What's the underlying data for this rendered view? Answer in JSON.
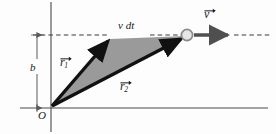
{
  "figure": {
    "type": "vector-diagram",
    "background_color": "#fdfdfd",
    "width": 276,
    "height": 134
  },
  "labels": {
    "v_dt": "v dt",
    "b": "b",
    "origin": "O",
    "r1_letter": "r",
    "r1_subscript": "1",
    "r2_letter": "r",
    "r2_subscript": "2",
    "v_letter": "v"
  },
  "colors": {
    "axis": "#4a4a4a",
    "dashed_line": "#3a3a3a",
    "vector_stroke": "#111111",
    "triangle_fill": "#9a9a9a",
    "velocity_arrow": "#4f4f4f",
    "particle_fill": "#e6e6e6",
    "particle_stroke": "#8a8a8a",
    "dimension_arrow": "#5a5a5a",
    "text": "#1a1a1a"
  },
  "geometry": {
    "origin": {
      "x": 51,
      "y": 108
    },
    "vertical_axis": {
      "x": 51,
      "y_top": 2,
      "y_bottom": 132
    },
    "horizontal_axis": {
      "y": 108,
      "x_left": 20,
      "x_right": 268
    },
    "dashed_trajectory": {
      "y": 35,
      "x_left": 33,
      "x_right": 271
    },
    "r1_tip": {
      "x": 112,
      "y": 37
    },
    "r2_tip": {
      "x": 184,
      "y": 38
    },
    "particle": {
      "x": 187,
      "y": 35,
      "radius": 6
    },
    "velocity_arrow": {
      "x_start": 193,
      "x_end": 233,
      "y": 35
    },
    "dimension_line_b": {
      "x": 37,
      "y_top": 35,
      "y_bottom": 108
    },
    "tick_marks": [
      {
        "x": 37,
        "y": 108
      }
    ]
  },
  "annotations": {
    "b_meaning": "perpendicular distance from origin to line of motion",
    "v_dt_meaning": "displacement of the particle in time dt",
    "triangle_meaning": "area swept by the radius vector in time dt"
  }
}
